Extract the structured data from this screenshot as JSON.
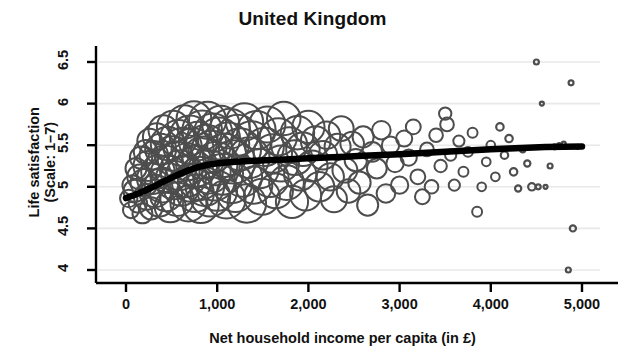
{
  "chart_data": {
    "type": "scatter",
    "title": "United Kingdom",
    "xlabel": "Net household income per capita (in £)",
    "ylabel_line1": "Life satisfaction",
    "ylabel_line2": "(Scale: 1–7)",
    "xlim": [
      -250,
      5150
    ],
    "ylim": [
      3.78,
      6.72
    ],
    "xticks": [
      0,
      1000,
      2000,
      3000,
      4000,
      5000
    ],
    "xticklabels": [
      "0",
      "1,000",
      "2,000",
      "3,000",
      "4,000",
      "5,000"
    ],
    "yticks": [
      4,
      4.5,
      5,
      5.5,
      6,
      6.5
    ],
    "yticklabels": [
      "4",
      "4.5",
      "5",
      "5.5",
      "6",
      "6.5"
    ],
    "grid": "horizontal",
    "grid_color": "#e8e8e8",
    "marker": "open-circle",
    "marker_color": "#4d4d4d",
    "trendline_color": "#000000",
    "legend": "none",
    "series": [
      {
        "name": "Life satisfaction by income (bubble size = sample weight)",
        "points": [
          [
            30,
            4.86,
            14
          ],
          [
            55,
            4.72,
            13
          ],
          [
            70,
            5.02,
            16
          ],
          [
            95,
            4.95,
            18
          ],
          [
            110,
            5.22,
            17
          ],
          [
            130,
            4.8,
            15
          ],
          [
            150,
            5.12,
            20
          ],
          [
            165,
            5.35,
            18
          ],
          [
            180,
            4.68,
            16
          ],
          [
            200,
            5.05,
            22
          ],
          [
            215,
            5.42,
            19
          ],
          [
            230,
            4.88,
            21
          ],
          [
            245,
            5.25,
            24
          ],
          [
            260,
            5.55,
            20
          ],
          [
            275,
            4.74,
            18
          ],
          [
            290,
            5.1,
            25
          ],
          [
            305,
            5.38,
            23
          ],
          [
            320,
            4.95,
            26
          ],
          [
            335,
            5.6,
            22
          ],
          [
            350,
            5.18,
            27
          ],
          [
            365,
            4.82,
            24
          ],
          [
            380,
            5.45,
            25
          ],
          [
            395,
            5.02,
            28
          ],
          [
            410,
            5.68,
            24
          ],
          [
            425,
            5.28,
            29
          ],
          [
            440,
            4.9,
            26
          ],
          [
            455,
            5.52,
            27
          ],
          [
            470,
            5.15,
            30
          ],
          [
            485,
            4.76,
            25
          ],
          [
            500,
            5.4,
            28
          ],
          [
            515,
            5.72,
            26
          ],
          [
            530,
            5.08,
            31
          ],
          [
            545,
            5.33,
            29
          ],
          [
            560,
            4.85,
            27
          ],
          [
            575,
            5.58,
            30
          ],
          [
            590,
            5.2,
            32
          ],
          [
            605,
            4.98,
            28
          ],
          [
            620,
            5.48,
            31
          ],
          [
            640,
            5.78,
            27
          ],
          [
            655,
            5.12,
            33
          ],
          [
            670,
            5.3,
            30
          ],
          [
            685,
            4.8,
            29
          ],
          [
            700,
            5.62,
            32
          ],
          [
            715,
            5.05,
            31
          ],
          [
            730,
            5.45,
            34
          ],
          [
            745,
            5.82,
            28
          ],
          [
            760,
            4.92,
            30
          ],
          [
            775,
            5.25,
            33
          ],
          [
            790,
            5.55,
            31
          ],
          [
            805,
            5.1,
            35
          ],
          [
            820,
            4.78,
            29
          ],
          [
            835,
            5.68,
            32
          ],
          [
            850,
            5.35,
            34
          ],
          [
            865,
            5.0,
            31
          ],
          [
            880,
            5.5,
            33
          ],
          [
            895,
            5.8,
            30
          ],
          [
            910,
            5.18,
            35
          ],
          [
            925,
            4.88,
            32
          ],
          [
            940,
            5.42,
            34
          ],
          [
            955,
            5.65,
            31
          ],
          [
            970,
            5.08,
            33
          ],
          [
            985,
            5.28,
            35
          ],
          [
            1000,
            4.95,
            32
          ],
          [
            1020,
            5.58,
            34
          ],
          [
            1040,
            5.75,
            30
          ],
          [
            1060,
            5.15,
            33
          ],
          [
            1080,
            5.38,
            35
          ],
          [
            1100,
            4.85,
            31
          ],
          [
            1120,
            5.52,
            34
          ],
          [
            1140,
            5.7,
            32
          ],
          [
            1160,
            5.05,
            33
          ],
          [
            1180,
            5.3,
            35
          ],
          [
            1200,
            4.92,
            30
          ],
          [
            1225,
            5.62,
            33
          ],
          [
            1250,
            5.45,
            34
          ],
          [
            1275,
            5.12,
            32
          ],
          [
            1300,
            5.78,
            30
          ],
          [
            1325,
            4.8,
            31
          ],
          [
            1350,
            5.35,
            33
          ],
          [
            1375,
            5.55,
            32
          ],
          [
            1400,
            5.02,
            30
          ],
          [
            1430,
            5.68,
            31
          ],
          [
            1460,
            5.22,
            32
          ],
          [
            1490,
            4.88,
            29
          ],
          [
            1520,
            5.48,
            31
          ],
          [
            1550,
            5.75,
            29
          ],
          [
            1580,
            5.1,
            30
          ],
          [
            1610,
            5.4,
            31
          ],
          [
            1640,
            4.95,
            28
          ],
          [
            1670,
            5.6,
            30
          ],
          [
            1700,
            5.28,
            29
          ],
          [
            1730,
            5.82,
            27
          ],
          [
            1760,
            5.05,
            28
          ],
          [
            1790,
            5.5,
            29
          ],
          [
            1820,
            4.82,
            26
          ],
          [
            1850,
            5.35,
            28
          ],
          [
            1880,
            5.65,
            27
          ],
          [
            1910,
            5.15,
            26
          ],
          [
            1940,
            5.45,
            27
          ],
          [
            1970,
            4.9,
            25
          ],
          [
            2000,
            5.72,
            26
          ],
          [
            2040,
            5.25,
            25
          ],
          [
            2080,
            5.55,
            24
          ],
          [
            2120,
            5.0,
            24
          ],
          [
            2160,
            5.38,
            23
          ],
          [
            2200,
            5.62,
            22
          ],
          [
            2240,
            5.12,
            22
          ],
          [
            2280,
            4.85,
            21
          ],
          [
            2320,
            5.48,
            21
          ],
          [
            2360,
            5.7,
            20
          ],
          [
            2400,
            5.2,
            20
          ],
          [
            2440,
            4.95,
            19
          ],
          [
            2480,
            5.52,
            19
          ],
          [
            2520,
            5.32,
            18
          ],
          [
            2560,
            5.05,
            18
          ],
          [
            2600,
            5.6,
            17
          ],
          [
            2650,
            4.78,
            17
          ],
          [
            2700,
            5.42,
            16
          ],
          [
            2750,
            5.22,
            16
          ],
          [
            2800,
            5.68,
            15
          ],
          [
            2850,
            4.92,
            15
          ],
          [
            2900,
            5.5,
            14
          ],
          [
            2950,
            5.28,
            14
          ],
          [
            3000,
            5.02,
            14
          ],
          [
            3050,
            5.58,
            13
          ],
          [
            3100,
            5.35,
            13
          ],
          [
            3150,
            5.72,
            12
          ],
          [
            3200,
            5.12,
            12
          ],
          [
            3250,
            4.88,
            12
          ],
          [
            3300,
            5.45,
            11
          ],
          [
            3350,
            5.0,
            11
          ],
          [
            3400,
            5.62,
            11
          ],
          [
            3450,
            5.25,
            10
          ],
          [
            3500,
            5.88,
            10
          ],
          [
            3520,
            5.75,
            11
          ],
          [
            3560,
            5.38,
            9
          ],
          [
            3600,
            5.02,
            9
          ],
          [
            3650,
            5.55,
            9
          ],
          [
            3700,
            5.18,
            8
          ],
          [
            3750,
            5.42,
            8
          ],
          [
            3800,
            5.65,
            8
          ],
          [
            3850,
            4.7,
            8
          ],
          [
            3900,
            5.0,
            7
          ],
          [
            3950,
            5.3,
            7
          ],
          [
            4000,
            5.5,
            7
          ],
          [
            4050,
            5.12,
            7
          ],
          [
            4100,
            5.72,
            6
          ],
          [
            4150,
            5.38,
            6
          ],
          [
            4200,
            5.58,
            6
          ],
          [
            4250,
            5.18,
            6
          ],
          [
            4300,
            4.98,
            5
          ],
          [
            4350,
            5.45,
            5
          ],
          [
            4400,
            5.28,
            5
          ],
          [
            4450,
            5.0,
            6
          ],
          [
            4500,
            6.5,
            4
          ],
          [
            4520,
            5.0,
            4
          ],
          [
            4560,
            6.0,
            3
          ],
          [
            4600,
            5.0,
            3
          ],
          [
            4650,
            5.25,
            4
          ],
          [
            4700,
            5.48,
            4
          ],
          [
            4750,
            5.5,
            3
          ],
          [
            4800,
            5.52,
            3
          ],
          [
            4850,
            4.0,
            4
          ],
          [
            4880,
            6.25,
            4
          ],
          [
            4900,
            4.5,
            5
          ],
          [
            4950,
            5.48,
            3
          ]
        ]
      }
    ],
    "trendline": {
      "name": "lowess fit",
      "points": [
        [
          0,
          4.865
        ],
        [
          100,
          4.905
        ],
        [
          200,
          4.95
        ],
        [
          300,
          5.0
        ],
        [
          400,
          5.055
        ],
        [
          500,
          5.11
        ],
        [
          600,
          5.16
        ],
        [
          700,
          5.205
        ],
        [
          800,
          5.24
        ],
        [
          900,
          5.265
        ],
        [
          1000,
          5.282
        ],
        [
          1200,
          5.3
        ],
        [
          1400,
          5.312
        ],
        [
          1600,
          5.322
        ],
        [
          1800,
          5.332
        ],
        [
          2000,
          5.342
        ],
        [
          2200,
          5.352
        ],
        [
          2400,
          5.362
        ],
        [
          2600,
          5.372
        ],
        [
          2800,
          5.382
        ],
        [
          3000,
          5.392
        ],
        [
          3200,
          5.403
        ],
        [
          3400,
          5.414
        ],
        [
          3600,
          5.426
        ],
        [
          3800,
          5.438
        ],
        [
          4000,
          5.45
        ],
        [
          4200,
          5.461
        ],
        [
          4400,
          5.47
        ],
        [
          4600,
          5.477
        ],
        [
          4800,
          5.482
        ],
        [
          5000,
          5.485
        ]
      ]
    }
  }
}
